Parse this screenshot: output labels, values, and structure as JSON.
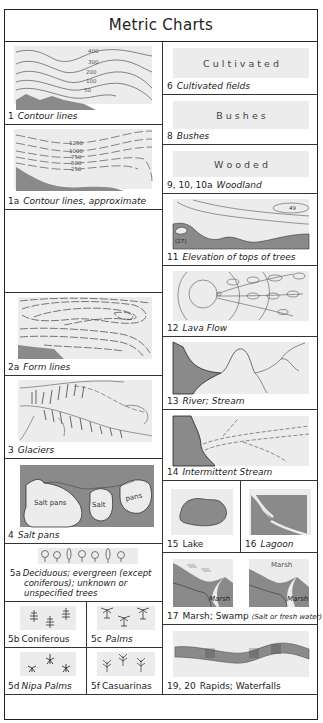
{
  "title": "Metric Charts",
  "colors": {
    "dark_fill": "#8a8a8a",
    "light_panel": "#ececec",
    "line": "#333333"
  },
  "left_column": [
    {
      "id": "contour",
      "number": "1",
      "label": "Contour lines",
      "contour_values": [
        "400",
        "300",
        "200",
        "100",
        "50"
      ]
    },
    {
      "id": "contour-approx",
      "number": "1a",
      "label": "Contour lines, approximate",
      "contour_values": [
        "1250",
        "1000",
        "750",
        "500",
        "250"
      ]
    },
    {
      "id": "empty",
      "number": "",
      "label": ""
    },
    {
      "id": "form-lines",
      "number": "2a",
      "label": "Form lines"
    },
    {
      "id": "glaciers",
      "number": "3",
      "label": "Glaciers"
    },
    {
      "id": "salt-pans",
      "number": "4",
      "label": "Salt pans",
      "map_labels": [
        "Salt pans",
        "Salt",
        "pans"
      ]
    },
    {
      "id": "deciduous",
      "number": "5a",
      "label": "Deciduous; evergreen (except coniferous); unknown or unspecified trees",
      "label_lines": [
        "Deciduous; evergreen (except",
        "coniferous); unknown or",
        "unspecified trees"
      ]
    }
  ],
  "tree_grid": [
    {
      "id": "coniferous",
      "number": "5b",
      "label": "Coniferous"
    },
    {
      "id": "palms",
      "number": "5c",
      "label": "Palms"
    },
    {
      "id": "nipa-palms",
      "number": "5d",
      "label": "Nipa Palms"
    },
    {
      "id": "casuarinas",
      "number": "5f",
      "label": "Casuarinas"
    }
  ],
  "right_column": [
    {
      "id": "cultivated",
      "number": "6",
      "label": "Cultivated fields",
      "panel_word": "C u l t i v a t e d"
    },
    {
      "id": "bushes",
      "number": "8",
      "label": "Bushes",
      "panel_word": "B u s h e s"
    },
    {
      "id": "wooded",
      "number": "9, 10, 10a",
      "label": "Woodland",
      "panel_word": "W   o   o   d   e   d"
    },
    {
      "id": "elevation",
      "number": "11",
      "label": "Elevation of tops of trees",
      "values": [
        "49",
        "(27)"
      ]
    },
    {
      "id": "lava",
      "number": "12",
      "label": "Lava Flow"
    },
    {
      "id": "river",
      "number": "13",
      "label": "River; Stream"
    },
    {
      "id": "intermittent",
      "number": "14",
      "label": "Intermittent Stream"
    },
    {
      "id": "lake",
      "number": "15",
      "label": "Lake"
    },
    {
      "id": "lagoon",
      "number": "16",
      "label": "Lagoon"
    },
    {
      "id": "marsh",
      "number": "17",
      "label": "Marsh; Swamp",
      "note": "(Salt or fresh water)",
      "map_labels": [
        "Marsh",
        "Marsh",
        "Marsh"
      ]
    },
    {
      "id": "rapids",
      "number": "19, 20",
      "label": "Rapids; Waterfalls"
    }
  ]
}
